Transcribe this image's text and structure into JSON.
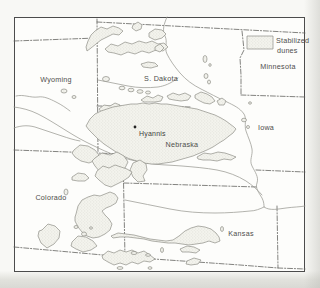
{
  "legend": {
    "line1": "Stabilized",
    "line2": "dunes"
  },
  "states": [
    {
      "id": "wyoming",
      "label": "Wyoming"
    },
    {
      "id": "s-dakota",
      "label": "S. Dakota"
    },
    {
      "id": "minnesota",
      "label": "Minnesota"
    },
    {
      "id": "iowa",
      "label": "Iowa"
    },
    {
      "id": "nebraska",
      "label": "Nebraska"
    },
    {
      "id": "colorado",
      "label": "Colorado"
    },
    {
      "id": "kansas",
      "label": "Kansas"
    }
  ],
  "city": {
    "label": "Hyannis"
  },
  "colors": {
    "frame": "#4c4c4c",
    "state_border": "#636360",
    "river": "#9a9a93",
    "dune_fill": "#f3f3ed",
    "dune_stipple": "#c9c9c0",
    "dune_outline": "#87877f",
    "label_text": "#4e4e4c",
    "page_background": "#f8f8f5"
  }
}
